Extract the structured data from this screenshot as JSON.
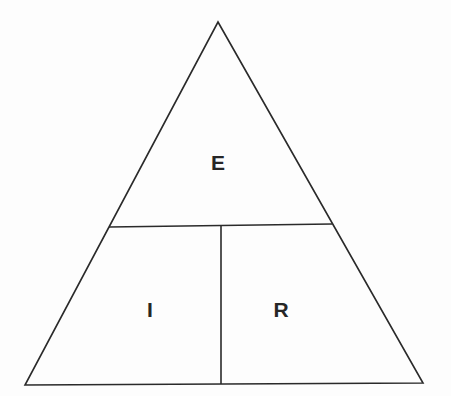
{
  "diagram": {
    "type": "triangle-hierarchy",
    "background_color": "#fdfdfd",
    "line_color": "#2a2a2a",
    "label_color": "#262626",
    "stroke_width": 1.6,
    "canvas": {
      "width": 451,
      "height": 396
    },
    "outline": {
      "name": "triangle-outline",
      "apex": {
        "x": 218,
        "y": 22
      },
      "bottom_left": {
        "x": 25,
        "y": 385
      },
      "bottom_right": {
        "x": 423,
        "y": 383
      }
    },
    "dividers": [
      {
        "name": "horizontal-divider",
        "orientation": "horizontal",
        "start": {
          "x": 109,
          "y": 227
        },
        "end": {
          "x": 332,
          "y": 224
        }
      },
      {
        "name": "vertical-divider",
        "orientation": "vertical",
        "start": {
          "x": 221,
          "y": 226
        },
        "end": {
          "x": 221,
          "y": 384
        }
      }
    ],
    "regions": [
      {
        "id": "top",
        "label": "E",
        "label_x": 218,
        "label_y": 162,
        "description": "upper apex region"
      },
      {
        "id": "bottom-left",
        "label": "I",
        "label_x": 150,
        "label_y": 309,
        "description": "lower left region"
      },
      {
        "id": "bottom-right",
        "label": "R",
        "label_x": 281,
        "label_y": 309,
        "description": "lower right region"
      }
    ]
  }
}
